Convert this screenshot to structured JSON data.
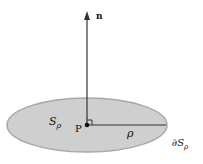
{
  "diagram": {
    "normal_label": "n",
    "surface_label": "S",
    "surface_sub": "ρ",
    "point_label": "P",
    "radius_label": "ρ",
    "boundary_label": "∂S",
    "boundary_sub": "ρ",
    "colors": {
      "disk_fill": "#cfcfcf",
      "disk_stroke": "#a8a8a8",
      "line": "#333333"
    }
  }
}
